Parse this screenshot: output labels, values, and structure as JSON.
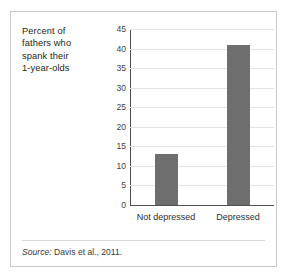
{
  "figure": {
    "caption_lines": [
      "Percent of",
      "fathers who",
      "spank their",
      "1-year-olds"
    ],
    "source": {
      "label": "Source:",
      "text": "Davis et al., 2011."
    }
  },
  "chart_data": {
    "type": "bar",
    "title": "",
    "subtitle": "",
    "xlabel": "",
    "ylabel": "Percent of fathers who spank their 1-year-olds",
    "categories": [
      "Not depressed",
      "Depressed"
    ],
    "values": [
      13,
      41
    ],
    "ylim": [
      0,
      45
    ],
    "ytick_step": 5,
    "yticks": [
      0,
      5,
      10,
      15,
      20,
      25,
      30,
      35,
      40,
      45
    ],
    "ytick_labels": [
      "0",
      "5",
      "10",
      "15",
      "20",
      "25",
      "30",
      "35",
      "40",
      "45"
    ],
    "grid": true,
    "grid_axis": "y",
    "legend": false,
    "legend_position": "none",
    "bar_color": "#6e6e6e",
    "grid_color": "#e4e4e4",
    "axis_color": "#4f4f4f",
    "annotations": []
  }
}
